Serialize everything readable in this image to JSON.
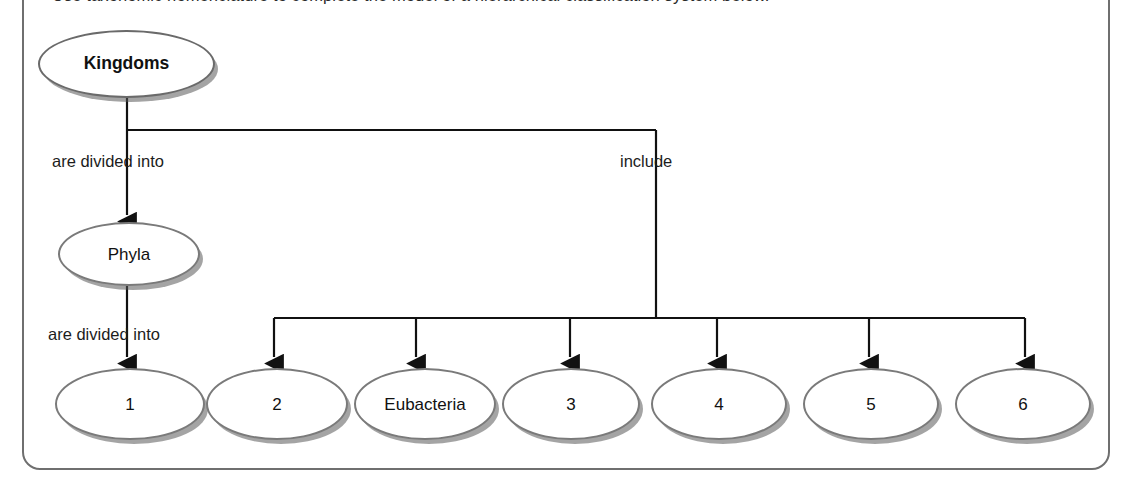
{
  "instruction": "Use taxonomic nomenclature to complete the model of a hierarchical classification system below.",
  "diagram": {
    "root": {
      "label": "Kingdoms"
    },
    "edge_labels": [
      {
        "id": "kingdoms-to-phyla",
        "text": "are divided into"
      },
      {
        "id": "kingdoms-to-kingdom-list",
        "text": "include"
      },
      {
        "id": "phyla-to-classes",
        "text": "are divided into"
      }
    ],
    "mid": {
      "label": "Phyla"
    },
    "bottom_nodes": [
      {
        "label": "1"
      },
      {
        "label": "2"
      },
      {
        "label": "Eubacteria"
      },
      {
        "label": "3"
      },
      {
        "label": "4"
      },
      {
        "label": "5"
      },
      {
        "label": "6"
      }
    ]
  },
  "colors": {
    "node_outline": "#7a7a7a",
    "node_shadow": "#5a5a5a",
    "connector": "#111111",
    "frame": "#6f6f6f",
    "text": "#1c1c1c",
    "background": "#ffffff"
  }
}
